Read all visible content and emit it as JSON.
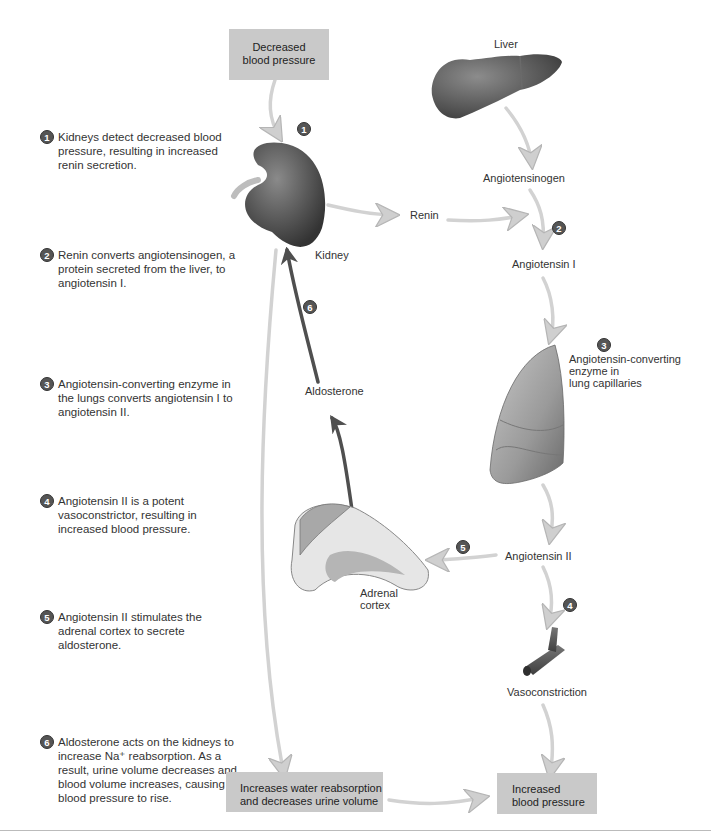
{
  "steps": [
    {
      "num": "1",
      "text": "Kidneys detect decreased blood pressure, resulting in increased renin secretion."
    },
    {
      "num": "2",
      "text": "Renin converts angiotensinogen, a protein secreted from the liver, to angiotensin I."
    },
    {
      "num": "3",
      "text": "Angiotensin-converting enzyme in the lungs converts angiotensin I to angiotensin II."
    },
    {
      "num": "4",
      "text": "Angiotensin II is a potent vasoconstrictor, resulting in increased blood pressure."
    },
    {
      "num": "5",
      "text": "Angiotensin II stimulates the adrenal cortex to secrete aldosterone."
    },
    {
      "num": "6",
      "text": "Aldosterone acts on the kidneys to increase Na⁺ reabsorption. As a result, urine volume decreases and blood volume increases, causing blood pressure to rise."
    }
  ],
  "boxes": {
    "decreased_bp": {
      "line1": "Decreased",
      "line2": "blood pressure"
    },
    "water_reabsorption": {
      "line1": "Increases water reabsorption",
      "line2": "and decreases urine volume"
    },
    "increased_bp": {
      "line1": "Increased",
      "line2": "blood pressure"
    }
  },
  "labels": {
    "liver": "Liver",
    "angiotensinogen": "Angiotensinogen",
    "renin": "Renin",
    "kidney": "Kidney",
    "angiotensin_i": "Angiotensin I",
    "ace_line1": "Angiotensin-converting",
    "ace_line2": "enzyme in",
    "ace_line3": "lung capillaries",
    "aldosterone": "Aldosterone",
    "angiotensin_ii": "Angiotensin II",
    "adrenal_line1": "Adrenal",
    "adrenal_line2": "cortex",
    "vasoconstriction": "Vasoconstriction"
  },
  "badges": [
    "1",
    "2",
    "3",
    "4",
    "5",
    "6"
  ],
  "colors": {
    "box_fill": "#c9c9c9",
    "arrow_light": "#d4d4d4",
    "arrow_dark": "#555555",
    "badge": "#555555",
    "organ_dark": "#4a4a4a"
  }
}
